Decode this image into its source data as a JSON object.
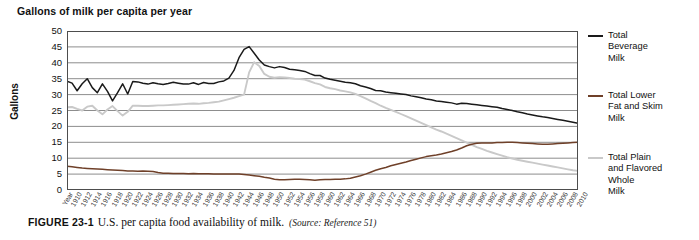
{
  "chart_title": "Gallons of milk per capita per year",
  "y_axis_title": "Gallons",
  "x_axis_first_label": "Year",
  "caption": {
    "figure_number": "FIGURE 23-1",
    "text": "U.S. per capita food availability of milk.",
    "source": "(Source: Reference 51)"
  },
  "legend": {
    "items": [
      {
        "label_line1": "Total",
        "label_line2": "Beverage",
        "label_line3": "Milk",
        "color": "#1a1a1a"
      },
      {
        "label_line1": "Total Lower",
        "label_line2": "Fat and Skim",
        "label_line3": "Milk",
        "color": "#6f4029"
      },
      {
        "label_line1": "Total Plain",
        "label_line2": "and Flavored",
        "label_line3": "Whole",
        "label_line4": "Milk",
        "color": "#c9c9c9"
      }
    ]
  },
  "colors": {
    "total_beverage": "#1a1a1a",
    "lower_fat_skim": "#6f4029",
    "whole_milk": "#c9c9c9",
    "gridline": "#808080",
    "axis": "#4d4d4d",
    "background": "#ffffff"
  },
  "chart_data": {
    "type": "line",
    "title": "Gallons of milk per capita per year",
    "xlabel": "Year",
    "ylabel": "Gallons",
    "ylim": [
      0,
      50
    ],
    "ytick_labels": [
      "50",
      "45",
      "40",
      "35",
      "30",
      "25",
      "20",
      "15",
      "10",
      "5",
      "0"
    ],
    "yticks": [
      50,
      45,
      40,
      35,
      30,
      25,
      20,
      15,
      10,
      5,
      0
    ],
    "grid": true,
    "legend_position": "right",
    "xlim": [
      1909,
      2010
    ],
    "categories": [
      "1909",
      "1910",
      "1911",
      "1912",
      "1913",
      "1914",
      "1915",
      "1916",
      "1917",
      "1918",
      "1919",
      "1920",
      "1921",
      "1922",
      "1923",
      "1924",
      "1925",
      "1926",
      "1927",
      "1928",
      "1929",
      "1930",
      "1931",
      "1932",
      "1933",
      "1934",
      "1935",
      "1936",
      "1937",
      "1938",
      "1939",
      "1940",
      "1941",
      "1942",
      "1943",
      "1944",
      "1945",
      "1946",
      "1947",
      "1948",
      "1949",
      "1950",
      "1951",
      "1952",
      "1953",
      "1954",
      "1955",
      "1956",
      "1957",
      "1958",
      "1959",
      "1960",
      "1961",
      "1962",
      "1963",
      "1964",
      "1965",
      "1966",
      "1967",
      "1968",
      "1969",
      "1970",
      "1971",
      "1972",
      "1973",
      "1974",
      "1975",
      "1976",
      "1977",
      "1978",
      "1979",
      "1980",
      "1981",
      "1982",
      "1983",
      "1984",
      "1985",
      "1986",
      "1987",
      "1988",
      "1989",
      "1990",
      "1991",
      "1992",
      "1993",
      "1994",
      "1995",
      "1996",
      "1997",
      "1998",
      "1999",
      "2000",
      "2001",
      "2002",
      "2003",
      "2004",
      "2005",
      "2006",
      "2007",
      "2008",
      "2009",
      "2010"
    ],
    "xtick_labels": [
      "Year",
      "1910",
      "1912",
      "1914",
      "1916",
      "1918",
      "1920",
      "1922",
      "1924",
      "1926",
      "1928",
      "1930",
      "1932",
      "1934",
      "1936",
      "1938",
      "1940",
      "1942",
      "1944",
      "1946",
      "1948",
      "1950",
      "1952",
      "1954",
      "1956",
      "1958",
      "1960",
      "1962",
      "1964",
      "1966",
      "1968",
      "1970",
      "1972",
      "1974",
      "1976",
      "1978",
      "1980",
      "1982",
      "1984",
      "1986",
      "1988",
      "1990",
      "1992",
      "1994",
      "1996",
      "1998",
      "2000",
      "2002",
      "2004",
      "2006",
      "2008",
      "2010"
    ],
    "series": [
      {
        "name": "Total Beverage Milk",
        "color": "#1a1a1a",
        "values": [
          34.2,
          33.6,
          31.2,
          33.4,
          35.0,
          32.2,
          30.6,
          33.4,
          31.0,
          28.0,
          30.6,
          33.4,
          30.2,
          34.1,
          34.0,
          33.6,
          33.3,
          33.7,
          33.4,
          33.2,
          33.5,
          33.9,
          33.6,
          33.3,
          33.3,
          33.7,
          33.2,
          33.8,
          33.5,
          33.5,
          34.0,
          34.3,
          35.2,
          37.6,
          41.6,
          44.2,
          45.1,
          43.0,
          40.9,
          39.3,
          38.8,
          38.4,
          38.8,
          38.5,
          38.0,
          37.8,
          37.6,
          37.3,
          36.6,
          36.0,
          36.0,
          35.2,
          34.8,
          34.5,
          34.2,
          33.9,
          33.7,
          33.4,
          32.8,
          32.4,
          31.9,
          31.3,
          31.2,
          30.8,
          30.6,
          30.4,
          30.2,
          30.0,
          29.6,
          29.3,
          29.0,
          28.6,
          28.4,
          28.0,
          27.8,
          27.6,
          27.4,
          27.0,
          27.3,
          27.2,
          27.0,
          26.8,
          26.6,
          26.4,
          26.2,
          26.0,
          25.6,
          25.3,
          25.0,
          24.6,
          24.3,
          23.9,
          23.6,
          23.3,
          23.0,
          22.8,
          22.5,
          22.2,
          21.9,
          21.6,
          21.3,
          21.0
        ]
      },
      {
        "name": "Total Lower Fat and Skim Milk",
        "color": "#6f4029",
        "values": [
          7.5,
          7.3,
          7.1,
          6.9,
          6.8,
          6.7,
          6.6,
          6.5,
          6.4,
          6.3,
          6.2,
          6.1,
          6.0,
          6.0,
          5.9,
          6.0,
          5.9,
          5.8,
          5.5,
          5.3,
          5.3,
          5.2,
          5.2,
          5.2,
          5.1,
          5.2,
          5.1,
          5.1,
          5.1,
          5.0,
          5.0,
          5.0,
          5.0,
          5.0,
          5.0,
          4.9,
          4.7,
          4.5,
          4.3,
          4.0,
          3.8,
          3.4,
          3.2,
          3.2,
          3.3,
          3.4,
          3.4,
          3.3,
          3.2,
          3.1,
          3.2,
          3.3,
          3.3,
          3.4,
          3.4,
          3.5,
          3.7,
          4.1,
          4.5,
          5.0,
          5.6,
          6.2,
          6.7,
          7.1,
          7.6,
          8.0,
          8.4,
          8.8,
          9.3,
          9.7,
          10.1,
          10.5,
          10.8,
          11.0,
          11.3,
          11.7,
          12.1,
          12.6,
          13.2,
          13.9,
          14.4,
          14.7,
          14.8,
          14.8,
          14.8,
          14.9,
          14.9,
          15.0,
          15.0,
          14.9,
          14.8,
          14.7,
          14.6,
          14.5,
          14.4,
          14.4,
          14.5,
          14.6,
          14.7,
          14.8,
          14.9,
          15.0
        ]
      },
      {
        "name": "Total Plain and Flavored Whole Milk",
        "color": "#c9c9c9",
        "values": [
          26.0,
          26.1,
          25.5,
          25.0,
          26.2,
          26.5,
          25.0,
          23.8,
          25.3,
          26.4,
          24.8,
          23.4,
          24.6,
          26.5,
          26.5,
          26.4,
          26.4,
          26.5,
          26.6,
          26.6,
          26.7,
          26.8,
          26.9,
          27.0,
          27.1,
          27.2,
          27.1,
          27.3,
          27.4,
          27.6,
          27.8,
          28.2,
          28.6,
          29.0,
          29.5,
          30.0,
          37.0,
          40.2,
          39.0,
          36.5,
          35.6,
          35.3,
          35.5,
          35.4,
          35.2,
          35.0,
          34.9,
          34.7,
          34.2,
          33.6,
          33.2,
          32.4,
          32.0,
          31.7,
          31.3,
          31.0,
          30.7,
          30.2,
          29.5,
          28.8,
          28.0,
          27.3,
          26.5,
          25.8,
          25.2,
          24.6,
          23.9,
          23.2,
          22.5,
          21.8,
          21.1,
          20.4,
          19.7,
          19.0,
          18.4,
          17.7,
          17.0,
          16.3,
          15.6,
          14.9,
          14.2,
          13.5,
          12.9,
          12.3,
          11.8,
          11.3,
          10.8,
          10.3,
          9.9,
          9.5,
          9.2,
          8.9,
          8.6,
          8.3,
          8.0,
          7.7,
          7.4,
          7.1,
          6.8,
          6.5,
          6.2,
          6.0
        ]
      }
    ]
  }
}
